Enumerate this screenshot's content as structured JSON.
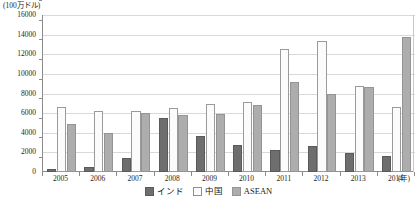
{
  "chart_data": {
    "type": "bar",
    "title": "",
    "subtitle": "",
    "xlabel": "(年)",
    "ylabel": "(100万ドル)",
    "ylim": [
      0,
      16000
    ],
    "ytick_step": 2000,
    "yticks": [
      0,
      2000,
      4000,
      6000,
      8000,
      10000,
      12000,
      14000,
      16000
    ],
    "ytick_labels": [
      "0",
      "2000",
      "4000",
      "6000",
      "8000",
      "10000",
      "12000",
      "14000",
      "16000"
    ],
    "categories": [
      "2005",
      "2006",
      "2007",
      "2008",
      "2009",
      "2010",
      "2011",
      "2012",
      "2013",
      "2014"
    ],
    "grid": true,
    "grid_axis": "y",
    "legend_position": "bottom",
    "series": [
      {
        "name": "インド",
        "color": "#6e6e6e",
        "border": "#5a5a5a",
        "values": [
          300,
          500,
          1450,
          5500,
          3650,
          2800,
          2200,
          2700,
          1900,
          1600
        ]
      },
      {
        "name": "中国",
        "color": "#fbfbfb",
        "border": "#9a9a9a",
        "values": [
          6600,
          6200,
          6200,
          6500,
          6900,
          7150,
          12550,
          13400,
          8800,
          6600
        ]
      },
      {
        "name": "ASEAN",
        "color": "#adadad",
        "border": "#949494",
        "values": [
          4900,
          3950,
          6000,
          5800,
          5900,
          6800,
          9200,
          7900,
          8700,
          13800
        ]
      }
    ]
  },
  "axis": {
    "y_unit_caption": "(100万ドル)",
    "x_unit_caption": "(年)"
  },
  "legend": {
    "items": [
      {
        "label": "インド"
      },
      {
        "label": "中国"
      },
      {
        "label": "ASEAN"
      }
    ]
  },
  "caption": {
    "faint_text": ""
  }
}
